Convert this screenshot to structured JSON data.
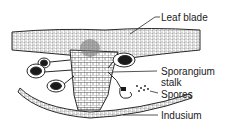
{
  "diagram": {
    "labels": [
      {
        "id": "leaf-blade",
        "text": "Leaf blade"
      },
      {
        "id": "sporangium-stalk",
        "line1": "Sporangium",
        "line2": "stalk"
      },
      {
        "id": "spores",
        "text": "Spores"
      },
      {
        "id": "indusium",
        "text": "Indusium"
      }
    ],
    "colors": {
      "line": "#2a2a2a",
      "fill": "#ffffff",
      "dark": "#1a1a1a"
    }
  }
}
